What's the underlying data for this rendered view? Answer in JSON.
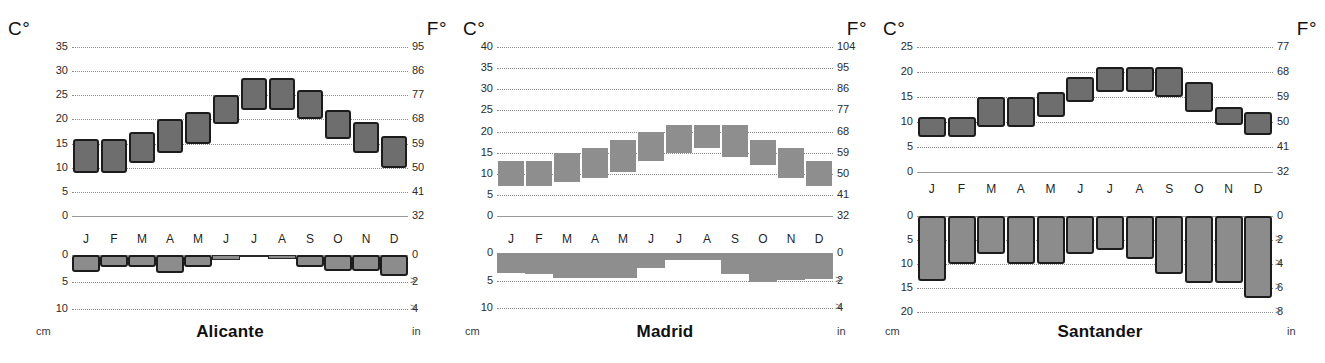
{
  "figure": {
    "axis_unit_left": "cm",
    "axis_unit_right": "in",
    "header_celsius": "C°",
    "header_fahrenheit": "F°",
    "months": [
      "J",
      "F",
      "M",
      "A",
      "M",
      "J",
      "J",
      "A",
      "S",
      "O",
      "N",
      "D"
    ],
    "bar_fill": "#6e6e6e",
    "bar_stroke": "#1c1c1c",
    "grid_color": "#8a8a8a"
  },
  "panels": [
    {
      "city": "Alicante",
      "temp": {
        "c_ticks": [
          "35",
          "30",
          "25",
          "20",
          "15",
          "10",
          "5",
          "0"
        ],
        "c_values": [
          35,
          30,
          25,
          20,
          15,
          10,
          5,
          0
        ],
        "f_ticks": [
          "95",
          "86",
          "77",
          "68",
          "59",
          "50",
          "41",
          "32"
        ],
        "f_values": [
          95,
          86,
          77,
          68,
          59,
          50,
          41,
          32
        ],
        "ymin": 0,
        "ymax": 35
      },
      "prec": {
        "c_ticks": [
          "0",
          "5",
          "10"
        ],
        "c_values": [
          0,
          5,
          10
        ],
        "f_ticks": [
          "0",
          "2",
          "4"
        ],
        "f_values": [
          0,
          2,
          4
        ],
        "ymin": 0,
        "ymax": 10
      }
    },
    {
      "city": "Madrid",
      "temp": {
        "c_ticks": [
          "40",
          "35",
          "30",
          "25",
          "20",
          "15",
          "10",
          "5",
          "0"
        ],
        "c_values": [
          40,
          35,
          30,
          25,
          20,
          15,
          10,
          5,
          0
        ],
        "f_ticks": [
          "104",
          "95",
          "86",
          "77",
          "68",
          "59",
          "50",
          "41",
          "32"
        ],
        "f_values": [
          104,
          95,
          86,
          77,
          68,
          59,
          50,
          41,
          32
        ],
        "ymin": 0,
        "ymax": 40
      },
      "prec": {
        "c_ticks": [
          "0",
          "5",
          "10"
        ],
        "c_values": [
          0,
          5,
          10
        ],
        "f_ticks": [
          "0",
          "2",
          "4"
        ],
        "f_values": [
          0,
          2,
          4
        ],
        "ymin": 0,
        "ymax": 10
      }
    },
    {
      "city": "Santander",
      "temp": {
        "c_ticks": [
          "25",
          "20",
          "15",
          "10",
          "5",
          "0"
        ],
        "c_values": [
          25,
          20,
          15,
          10,
          5,
          0
        ],
        "f_ticks": [
          "77",
          "68",
          "59",
          "50",
          "41",
          "32"
        ],
        "f_values": [
          77,
          68,
          59,
          50,
          41,
          32
        ],
        "ymin": 0,
        "ymax": 25
      },
      "prec": {
        "c_ticks": [
          "0",
          "5",
          "10",
          "15",
          "20"
        ],
        "c_values": [
          0,
          5,
          10,
          15,
          20
        ],
        "f_ticks": [
          "0",
          "2",
          "4",
          "6",
          "8"
        ],
        "f_values": [
          0,
          2,
          4,
          6,
          8
        ],
        "ymin": 0,
        "ymax": 20
      }
    }
  ],
  "chart_data": [
    {
      "type": "bar",
      "title": "Alicante",
      "subtitle": "Monthly temperature range (min–max) and precipitation",
      "xlabel": "",
      "ylabel": "Temperature (C°)",
      "categories": [
        "J",
        "F",
        "M",
        "A",
        "M",
        "J",
        "J",
        "A",
        "S",
        "O",
        "N",
        "D"
      ],
      "ylim": [
        0,
        35
      ],
      "y2lim": [
        32,
        95
      ],
      "grid": true,
      "legend": "none",
      "series": [
        {
          "name": "Temp min (C°)",
          "values": [
            9,
            9,
            11,
            13,
            15,
            19,
            22,
            22,
            20,
            16,
            13,
            10
          ]
        },
        {
          "name": "Temp max (C°)",
          "values": [
            16,
            16,
            17.5,
            20,
            21.5,
            25,
            28.5,
            28.5,
            26,
            22,
            19.5,
            16.5
          ]
        }
      ],
      "secondary_axis": {
        "label": "Precipitation (cm)",
        "ylim": [
          0,
          10
        ],
        "y2lim": [
          0,
          4
        ]
      },
      "precipitation_cm": [
        3.2,
        2.2,
        2.2,
        3.4,
        2.3,
        0.9,
        0.2,
        0.8,
        2.2,
        3.0,
        3.0,
        3.9
      ]
    },
    {
      "type": "bar",
      "title": "Madrid",
      "subtitle": "Monthly temperature range (min–max) and precipitation",
      "xlabel": "",
      "ylabel": "Temperature (C°)",
      "categories": [
        "J",
        "F",
        "M",
        "A",
        "M",
        "J",
        "J",
        "A",
        "S",
        "O",
        "N",
        "D"
      ],
      "ylim": [
        0,
        40
      ],
      "y2lim": [
        32,
        104
      ],
      "grid": true,
      "legend": "none",
      "series": [
        {
          "name": "Temp min (C°)",
          "values": [
            7,
            7,
            8,
            9,
            10.5,
            13,
            15,
            16,
            14,
            12,
            9,
            7
          ]
        },
        {
          "name": "Temp max (C°)",
          "values": [
            13,
            13,
            15,
            16,
            18,
            20,
            21.5,
            21.5,
            21.5,
            18,
            16,
            13
          ]
        }
      ],
      "secondary_axis": {
        "label": "Precipitation (cm)",
        "ylim": [
          0,
          10
        ],
        "y2lim": [
          0,
          4
        ]
      },
      "precipitation_cm": [
        3.7,
        3.9,
        4.6,
        4.6,
        4.6,
        2.8,
        1.2,
        1.3,
        3.9,
        5.3,
        4.9,
        4.8
      ]
    },
    {
      "type": "bar",
      "title": "Santander",
      "subtitle": "Monthly temperature range (min–max) and precipitation",
      "xlabel": "",
      "ylabel": "Temperature (C°)",
      "categories": [
        "J",
        "F",
        "M",
        "A",
        "M",
        "J",
        "J",
        "A",
        "S",
        "O",
        "N",
        "D"
      ],
      "ylim": [
        0,
        25
      ],
      "y2lim": [
        32,
        77
      ],
      "grid": true,
      "legend": "none",
      "series": [
        {
          "name": "Temp min (C°)",
          "values": [
            7,
            7,
            9,
            9,
            11,
            14,
            16,
            16,
            15,
            12,
            9.5,
            7.5
          ]
        },
        {
          "name": "Temp max (C°)",
          "values": [
            11,
            11,
            15,
            15,
            16,
            19,
            21,
            21,
            21,
            18,
            13,
            12
          ]
        }
      ],
      "secondary_axis": {
        "label": "Precipitation (cm)",
        "ylim": [
          0,
          20
        ],
        "y2lim": [
          0,
          8
        ]
      },
      "precipitation_cm": [
        13.5,
        10.0,
        8.0,
        10.0,
        10.0,
        8.0,
        7.0,
        9.0,
        12.0,
        14.0,
        14.0,
        17.0
      ]
    }
  ]
}
